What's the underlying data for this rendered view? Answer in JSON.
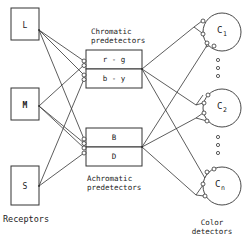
{
  "receptors": {
    "caption": "Receptors",
    "items": [
      {
        "label": "L"
      },
      {
        "label": "M"
      },
      {
        "label": "S"
      }
    ]
  },
  "chromatic": {
    "caption_line1": "Chromatic",
    "caption_line2": "predetectors",
    "items": [
      {
        "label": "r - g"
      },
      {
        "label": "b - y"
      }
    ]
  },
  "achromatic": {
    "caption_line1": "Achromatic",
    "caption_line2": "predetectors",
    "items": [
      {
        "label": "B"
      },
      {
        "label": "D"
      }
    ]
  },
  "detectors": {
    "caption_line1": "Color",
    "caption_line2": "detectors",
    "items": [
      {
        "label": "C",
        "sub": "1"
      },
      {
        "label": "C",
        "sub": "2"
      },
      {
        "label": "C",
        "sub": "n"
      }
    ],
    "ellipsis_icon": "vertical-dots"
  }
}
